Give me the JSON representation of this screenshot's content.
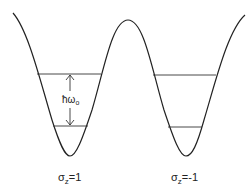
{
  "diagram": {
    "type": "double-well-potential",
    "colors": {
      "stroke": "#222222",
      "background": "#ffffff"
    },
    "wells": [
      {
        "id": "left",
        "label_sigma": "σ",
        "label_sub": "z",
        "label_value": "=1",
        "levels": 2,
        "spacing_label_main": "ħω",
        "spacing_label_sub": "o"
      },
      {
        "id": "right",
        "label_sigma": "σ",
        "label_sub": "z",
        "label_value": "=-1",
        "levels": 2
      }
    ]
  }
}
